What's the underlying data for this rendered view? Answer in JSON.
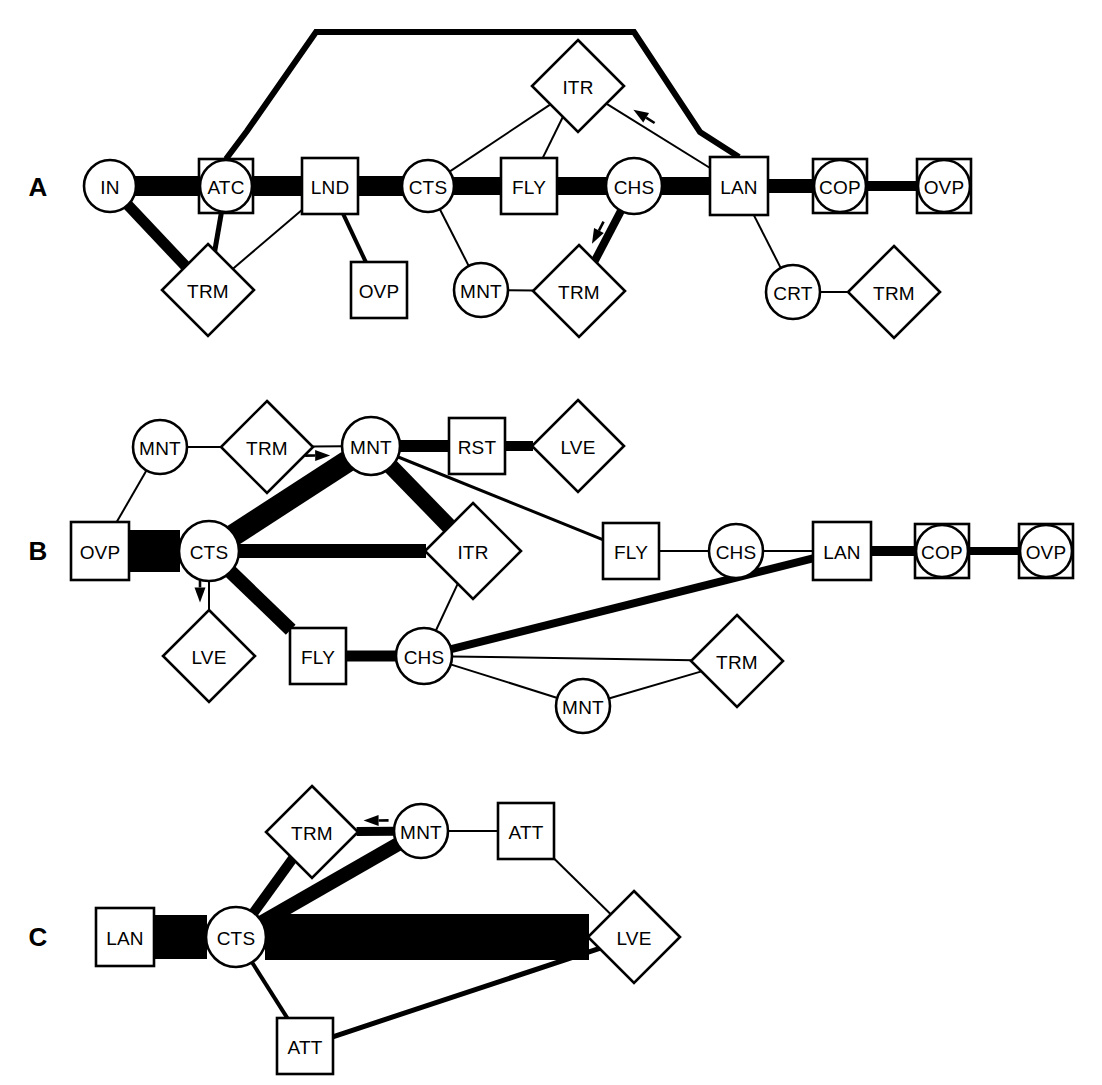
{
  "figure": {
    "background_color": "#ffffff",
    "line_color": "#000000",
    "panels": [
      "A",
      "B",
      "C"
    ]
  },
  "legend": {
    "shape_meaning": {
      "circle": "circle-node",
      "square": "square-node",
      "diamond": "diamond-node",
      "circle-in-square": "circle-in-square-node"
    },
    "edge_width_meaning": "transition frequency"
  },
  "panels": [
    {
      "id": "A",
      "label": "A",
      "label_pos": {
        "x": 38,
        "y": 187
      },
      "nodes": [
        {
          "id": "A_IN",
          "label": "IN",
          "shape": "circle",
          "x": 110,
          "y": 186,
          "r": 26
        },
        {
          "id": "A_ATC",
          "label": "ATC",
          "shape": "circle-in-square",
          "x": 226,
          "y": 186,
          "r": 26,
          "s": 54
        },
        {
          "id": "A_LND",
          "label": "LND",
          "shape": "square",
          "x": 330,
          "y": 186,
          "s": 56
        },
        {
          "id": "A_CTS",
          "label": "CTS",
          "shape": "circle",
          "x": 428,
          "y": 186,
          "r": 26
        },
        {
          "id": "A_FLY",
          "label": "FLY",
          "shape": "square",
          "x": 529,
          "y": 186,
          "s": 56
        },
        {
          "id": "A_CHS",
          "label": "CHS",
          "shape": "circle",
          "x": 634,
          "y": 186,
          "r": 28
        },
        {
          "id": "A_LAN",
          "label": "LAN",
          "shape": "square",
          "x": 739,
          "y": 186,
          "s": 58
        },
        {
          "id": "A_COP",
          "label": "COP",
          "shape": "circle-in-square",
          "x": 840,
          "y": 186,
          "r": 26,
          "s": 54
        },
        {
          "id": "A_OVP",
          "label": "OVP",
          "shape": "circle-in-square",
          "x": 944,
          "y": 186,
          "r": 26,
          "s": 54
        },
        {
          "id": "A_ITR",
          "label": "ITR",
          "shape": "diamond",
          "x": 578,
          "y": 86,
          "d": 46
        },
        {
          "id": "A_TRM1",
          "label": "TRM",
          "shape": "diamond",
          "x": 208,
          "y": 290,
          "d": 46
        },
        {
          "id": "A_OVP2",
          "label": "OVP",
          "shape": "square",
          "x": 379,
          "y": 290,
          "s": 56
        },
        {
          "id": "A_MNT",
          "label": "MNT",
          "shape": "circle",
          "x": 481,
          "y": 290,
          "r": 27
        },
        {
          "id": "A_TRM2",
          "label": "TRM",
          "shape": "diamond",
          "x": 579,
          "y": 291,
          "d": 46
        },
        {
          "id": "A_CRT",
          "label": "CRT",
          "shape": "circle",
          "x": 793,
          "y": 292,
          "r": 27
        },
        {
          "id": "A_TRM3",
          "label": "TRM",
          "shape": "diamond",
          "x": 894,
          "y": 292,
          "d": 46
        }
      ],
      "edges": [
        {
          "from": "A_IN",
          "to": "A_ATC",
          "width": 20
        },
        {
          "from": "A_ATC",
          "to": "A_LND",
          "width": 20
        },
        {
          "from": "A_LND",
          "to": "A_CTS",
          "width": 20
        },
        {
          "from": "A_CTS",
          "to": "A_FLY",
          "width": 18
        },
        {
          "from": "A_FLY",
          "to": "A_CHS",
          "width": 18
        },
        {
          "from": "A_CHS",
          "to": "A_LAN",
          "width": 18
        },
        {
          "from": "A_LAN",
          "to": "A_COP",
          "width": 14
        },
        {
          "from": "A_COP",
          "to": "A_OVP",
          "width": 10
        },
        {
          "from": "A_IN",
          "to": "A_TRM1",
          "width": 11
        },
        {
          "from": "A_ATC",
          "to": "A_TRM1",
          "width": 5
        },
        {
          "from": "A_LND",
          "to": "A_TRM1",
          "width": 2
        },
        {
          "from": "A_LND",
          "to": "A_OVP2",
          "width": 4
        },
        {
          "from": "A_CTS",
          "to": "A_MNT",
          "width": 2
        },
        {
          "from": "A_MNT",
          "to": "A_TRM2",
          "width": 2
        },
        {
          "from": "A_CHS",
          "to": "A_TRM2",
          "width": 8,
          "arrow": "to",
          "arrow_t": 0.62
        },
        {
          "from": "A_CTS",
          "to": "A_ITR",
          "width": 2
        },
        {
          "from": "A_FLY",
          "to": "A_ITR",
          "width": 2
        },
        {
          "from": "A_LAN",
          "to": "A_ITR",
          "width": 2,
          "arrow": "to",
          "arrow_t": 0.72
        },
        {
          "from": "A_LAN",
          "to": "A_CRT",
          "width": 2
        },
        {
          "from": "A_CRT",
          "to": "A_TRM3",
          "width": 2
        }
      ],
      "poly_edges": [
        {
          "name": "atc-to-lan-arc",
          "width": 6,
          "points": [
            [
              226,
              159
            ],
            [
              247,
              131
            ],
            [
              316,
              32
            ],
            [
              634,
              32
            ],
            [
              700,
              132
            ],
            [
              739,
              157
            ]
          ]
        }
      ]
    },
    {
      "id": "B",
      "label": "B",
      "label_pos": {
        "x": 38,
        "y": 551
      },
      "nodes": [
        {
          "id": "B_MNT1",
          "label": "MNT",
          "shape": "circle",
          "x": 160,
          "y": 447,
          "r": 27
        },
        {
          "id": "B_TRM1",
          "label": "TRM",
          "shape": "diamond",
          "x": 267,
          "y": 447,
          "d": 46
        },
        {
          "id": "B_MNT2",
          "label": "MNT",
          "shape": "circle",
          "x": 371,
          "y": 446,
          "r": 29
        },
        {
          "id": "B_RST",
          "label": "RST",
          "shape": "square",
          "x": 477,
          "y": 446,
          "s": 56
        },
        {
          "id": "B_LVE1",
          "label": "LVE",
          "shape": "diamond",
          "x": 578,
          "y": 446,
          "d": 46
        },
        {
          "id": "B_OVP1",
          "label": "OVP",
          "shape": "square",
          "x": 100,
          "y": 551,
          "s": 58
        },
        {
          "id": "B_CTS",
          "label": "CTS",
          "shape": "circle",
          "x": 209,
          "y": 551,
          "r": 30
        },
        {
          "id": "B_ITR",
          "label": "ITR",
          "shape": "diamond",
          "x": 473,
          "y": 551,
          "d": 48
        },
        {
          "id": "B_FLY2",
          "label": "FLY",
          "shape": "square",
          "x": 631,
          "y": 551,
          "s": 56
        },
        {
          "id": "B_CHS2",
          "label": "CHS",
          "shape": "circle",
          "x": 736,
          "y": 551,
          "r": 27
        },
        {
          "id": "B_LAN",
          "label": "LAN",
          "shape": "square",
          "x": 842,
          "y": 551,
          "s": 58
        },
        {
          "id": "B_COP",
          "label": "COP",
          "shape": "circle-in-square",
          "x": 942,
          "y": 551,
          "r": 26,
          "s": 54
        },
        {
          "id": "B_OVP2",
          "label": "OVP",
          "shape": "circle-in-square",
          "x": 1046,
          "y": 551,
          "r": 26,
          "s": 54
        },
        {
          "id": "B_LVE2",
          "label": "LVE",
          "shape": "diamond",
          "x": 209,
          "y": 656,
          "d": 46
        },
        {
          "id": "B_FLY1",
          "label": "FLY",
          "shape": "square",
          "x": 318,
          "y": 656,
          "s": 56
        },
        {
          "id": "B_CHS1",
          "label": "CHS",
          "shape": "circle",
          "x": 424,
          "y": 656,
          "r": 28
        },
        {
          "id": "B_TRM2",
          "label": "TRM",
          "shape": "diamond",
          "x": 737,
          "y": 661,
          "d": 46
        },
        {
          "id": "B_MNT3",
          "label": "MNT",
          "shape": "circle",
          "x": 583,
          "y": 706,
          "r": 27
        }
      ],
      "edges": [
        {
          "from": "B_MNT1",
          "to": "B_TRM1",
          "width": 2
        },
        {
          "from": "B_TRM1",
          "to": "B_MNT2",
          "width": 2,
          "arrow": "to",
          "arrow_t": 0.35
        },
        {
          "from": "B_MNT2",
          "to": "B_RST",
          "width": 12
        },
        {
          "from": "B_RST",
          "to": "B_LVE1",
          "width": 10
        },
        {
          "from": "B_MNT1",
          "to": "B_OVP1",
          "width": 2
        },
        {
          "from": "B_OVP1",
          "to": "B_CTS",
          "width": 42
        },
        {
          "from": "B_CTS",
          "to": "B_MNT2",
          "width": 22
        },
        {
          "from": "B_CTS",
          "to": "B_ITR",
          "width": 14
        },
        {
          "from": "B_MNT2",
          "to": "B_ITR",
          "width": 16
        },
        {
          "from": "B_MNT2",
          "to": "B_FLY2",
          "width": 3
        },
        {
          "from": "B_CTS",
          "to": "B_LVE2",
          "width": 2,
          "arrow": "to",
          "arrow_t": 0.48
        },
        {
          "from": "B_CTS",
          "to": "B_FLY1",
          "width": 14
        },
        {
          "from": "B_FLY1",
          "to": "B_CHS1",
          "width": 11
        },
        {
          "from": "B_CHS1",
          "to": "B_ITR",
          "width": 2
        },
        {
          "from": "B_CHS1",
          "to": "B_LAN",
          "width": 8
        },
        {
          "from": "B_CHS1",
          "to": "B_TRM2",
          "width": 2
        },
        {
          "from": "B_CHS1",
          "to": "B_MNT3",
          "width": 2
        },
        {
          "from": "B_MNT3",
          "to": "B_TRM2",
          "width": 2
        },
        {
          "from": "B_FLY2",
          "to": "B_CHS2",
          "width": 2
        },
        {
          "from": "B_CHS2",
          "to": "B_LAN",
          "width": 2
        },
        {
          "from": "B_LAN",
          "to": "B_COP",
          "width": 10
        },
        {
          "from": "B_COP",
          "to": "B_OVP2",
          "width": 8
        }
      ],
      "poly_edges": []
    },
    {
      "id": "C",
      "label": "C",
      "label_pos": {
        "x": 38,
        "y": 937
      },
      "nodes": [
        {
          "id": "C_TRM",
          "label": "TRM",
          "shape": "diamond",
          "x": 312,
          "y": 832,
          "d": 46
        },
        {
          "id": "C_MNT",
          "label": "MNT",
          "shape": "circle",
          "x": 421,
          "y": 831,
          "r": 27
        },
        {
          "id": "C_ATT1",
          "label": "ATT",
          "shape": "square",
          "x": 526,
          "y": 831,
          "s": 56
        },
        {
          "id": "C_LAN",
          "label": "LAN",
          "shape": "square",
          "x": 125,
          "y": 937,
          "s": 58
        },
        {
          "id": "C_CTS",
          "label": "CTS",
          "shape": "circle",
          "x": 236,
          "y": 937,
          "r": 30
        },
        {
          "id": "C_LVE",
          "label": "LVE",
          "shape": "diamond",
          "x": 634,
          "y": 937,
          "d": 46
        },
        {
          "id": "C_ATT2",
          "label": "ATT",
          "shape": "square",
          "x": 305,
          "y": 1046,
          "s": 56
        }
      ],
      "edges": [
        {
          "from": "C_TRM",
          "to": "C_MNT",
          "width": 9,
          "arrow": "to_rev",
          "arrow_t": 0.38
        },
        {
          "from": "C_MNT",
          "to": "C_ATT1",
          "width": 2
        },
        {
          "from": "C_LAN",
          "to": "C_CTS",
          "width": 44
        },
        {
          "from": "C_CTS",
          "to": "C_TRM",
          "width": 10
        },
        {
          "from": "C_CTS",
          "to": "C_MNT",
          "width": 14
        },
        {
          "from": "C_CTS",
          "to": "C_LVE",
          "width": 46
        },
        {
          "from": "C_CTS",
          "to": "C_ATT2",
          "width": 4
        },
        {
          "from": "C_ATT2",
          "to": "C_LVE",
          "width": 5
        },
        {
          "from": "C_ATT1",
          "to": "C_LVE",
          "width": 2
        }
      ],
      "poly_edges": []
    }
  ]
}
